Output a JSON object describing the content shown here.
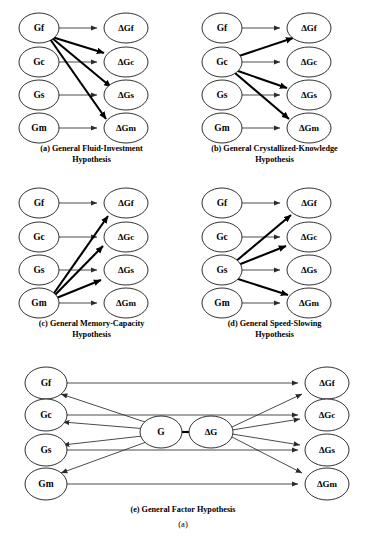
{
  "figure": {
    "label": "(a)",
    "nodes": {
      "gf": "Gf",
      "gc": "Gc",
      "gs": "Gs",
      "gm": "Gm",
      "dgf": "ΔGf",
      "dgc": "ΔGc",
      "dgs": "ΔGs",
      "dgm": "ΔGm",
      "g": "G",
      "dg": "ΔG"
    },
    "colors": {
      "background": "#ffffff",
      "node_stroke": "#1a1a1a",
      "thin_edge": "#2b2b2b",
      "thick_edge": "#000000",
      "text": "#000000"
    },
    "panels": [
      {
        "id": "a",
        "caption_lines": [
          "(a) General Fluid-Investment",
          "Hypothesis"
        ],
        "caption_full": "(a) General Fluid-Investment Hypothesis",
        "source_node": "Gf",
        "thin_edges": [
          "Gf → ΔGf",
          "Gc → ΔGc",
          "Gs → ΔGs",
          "Gm → ΔGm"
        ],
        "thick_edges": [
          "Gf → ΔGc",
          "Gf → ΔGs",
          "Gf → ΔGm"
        ]
      },
      {
        "id": "b",
        "caption_lines": [
          "(b) General Crystallized-Knowledge",
          "Hypothesis"
        ],
        "caption_full": "(b) General Crystallized-Knowledge Hypothesis",
        "source_node": "Gc",
        "thin_edges": [
          "Gf → ΔGf",
          "Gc → ΔGc",
          "Gs → ΔGs",
          "Gm → ΔGm"
        ],
        "thick_edges": [
          "Gc → ΔGf",
          "Gc → ΔGs",
          "Gc → ΔGm"
        ]
      },
      {
        "id": "c",
        "caption_lines": [
          "(c) General Memory-Capacity",
          "Hypothesis"
        ],
        "caption_full": "(c) General Memory-Capacity Hypothesis",
        "source_node": "Gm",
        "thin_edges": [
          "Gf → ΔGf",
          "Gc → ΔGc",
          "Gs → ΔGs",
          "Gm → ΔGm"
        ],
        "thick_edges": [
          "Gm → ΔGf",
          "Gm → ΔGc",
          "Gm → ΔGs"
        ]
      },
      {
        "id": "d",
        "caption_lines": [
          "(d) General Speed-Slowing",
          "Hypothesis"
        ],
        "caption_full": "(d) General Speed-Slowing Hypothesis",
        "source_node": "Gs",
        "thin_edges": [
          "Gf → ΔGf",
          "Gc → ΔGc",
          "Gs → ΔGs",
          "Gm → ΔGm"
        ],
        "thick_edges": [
          "Gs → ΔGf",
          "Gs → ΔGc",
          "Gs → ΔGm"
        ]
      },
      {
        "id": "e",
        "caption_lines": [
          "(e) General Factor Hypothesis"
        ],
        "caption_full": "(e) General Factor Hypothesis",
        "source_node": "G",
        "thin_edges": [
          "Gf → ΔGf",
          "Gc → ΔGc",
          "Gs → ΔGs",
          "Gm → ΔGm",
          "G → Gf",
          "G → Gc",
          "G → Gs",
          "G → Gm",
          "ΔG → ΔGf",
          "ΔG → ΔGc",
          "ΔG → ΔGs",
          "ΔG → ΔGm"
        ],
        "thick_edges": [
          "G → ΔG"
        ]
      }
    ]
  }
}
